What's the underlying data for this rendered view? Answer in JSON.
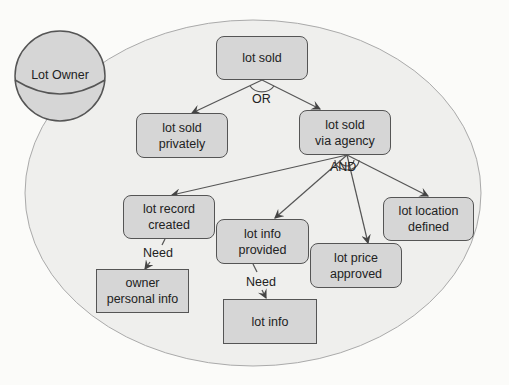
{
  "diagram": {
    "actor": {
      "label": "Lot Owner"
    },
    "goals": [
      {
        "id": "lot-sold",
        "label": "lot sold"
      },
      {
        "id": "lot-sold-privately",
        "label": "lot sold\nprivately"
      },
      {
        "id": "lot-sold-via-agency",
        "label": "lot sold\nvia agency"
      },
      {
        "id": "lot-record-created",
        "label": "lot record\ncreated"
      },
      {
        "id": "lot-info-provided",
        "label": "lot info\nprovided"
      },
      {
        "id": "lot-price-approved",
        "label": "lot price\napproved"
      },
      {
        "id": "lot-location-defined",
        "label": "lot location\ndefined"
      }
    ],
    "resources": [
      {
        "id": "owner-personal-info",
        "label": "owner\npersonal info"
      },
      {
        "id": "lot-info",
        "label": "lot info"
      }
    ],
    "decompositions": {
      "or_label": "OR",
      "and_label": "AND"
    },
    "links": {
      "need_1": "Need",
      "need_2": "Need"
    }
  }
}
